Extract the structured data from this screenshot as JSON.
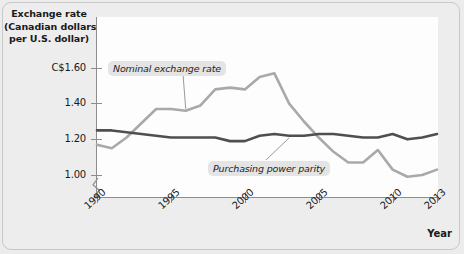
{
  "chart_data": {
    "type": "line",
    "title": "",
    "xlabel": "Year",
    "ylabel": "Exchange rate (Canadian dollars per U.S. dollar)",
    "ylabel_lines": [
      "Exchange rate",
      "(Canadian dollars",
      "per U.S. dollar)"
    ],
    "xlim": [
      1990,
      2013
    ],
    "ylim": [
      0.96,
      1.66
    ],
    "grid": false,
    "legend_position": "inline-annotations",
    "y_ticks": [
      {
        "value": 1.6,
        "label": "C$1.60"
      },
      {
        "value": 1.4,
        "label": "1.40"
      },
      {
        "value": 1.2,
        "label": "1.20"
      },
      {
        "value": 1.0,
        "label": "1.00"
      }
    ],
    "x_ticks": [
      {
        "value": 1990,
        "label": "1990"
      },
      {
        "value": 1995,
        "label": "1995"
      },
      {
        "value": 2000,
        "label": "2000"
      },
      {
        "value": 2005,
        "label": "2005"
      },
      {
        "value": 2010,
        "label": "2010"
      },
      {
        "value": 2013,
        "label": "2013"
      }
    ],
    "axis_break": true,
    "x": [
      1990,
      1991,
      1992,
      1993,
      1994,
      1995,
      1996,
      1997,
      1998,
      1999,
      2000,
      2001,
      2002,
      2003,
      2004,
      2005,
      2006,
      2007,
      2008,
      2009,
      2010,
      2011,
      2012,
      2013
    ],
    "series": [
      {
        "name": "Nominal exchange rate",
        "color": "#a9a9a9",
        "values": [
          1.17,
          1.15,
          1.21,
          1.29,
          1.37,
          1.37,
          1.36,
          1.39,
          1.48,
          1.49,
          1.48,
          1.55,
          1.57,
          1.4,
          1.3,
          1.21,
          1.13,
          1.07,
          1.07,
          1.14,
          1.03,
          0.99,
          1.0,
          1.03
        ]
      },
      {
        "name": "Purchasing power parity",
        "color": "#4f4f4f",
        "values": [
          1.25,
          1.25,
          1.24,
          1.23,
          1.22,
          1.21,
          1.21,
          1.21,
          1.21,
          1.19,
          1.19,
          1.22,
          1.23,
          1.22,
          1.22,
          1.23,
          1.23,
          1.22,
          1.21,
          1.21,
          1.23,
          1.2,
          1.21,
          1.23
        ]
      }
    ],
    "annotations": [
      {
        "name": "Nominal exchange rate",
        "label": "Nominal exchange rate",
        "points_to_year": 1996
      },
      {
        "name": "Purchasing power parity",
        "label": "Purchasing power parity",
        "points_to_year": 2003
      }
    ]
  },
  "axis": {
    "line_color": "#8d8d8d"
  }
}
